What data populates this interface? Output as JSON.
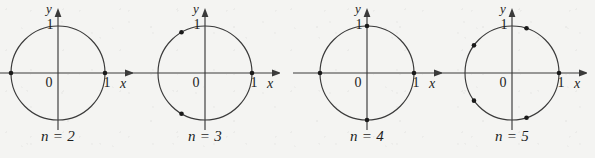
{
  "figure": {
    "background_color": "#f4f4f2",
    "stroke_color": "#3a3a3a",
    "dot_color": "#1a1a1a",
    "text_color": "#1d1d1d"
  },
  "axis_labels": {
    "origin": "0",
    "x_unit": "1",
    "y_unit": "1",
    "x_name": "x",
    "y_name": "y"
  },
  "chart_data": {
    "type": "scatter",
    "title": "",
    "xlabel": "x",
    "ylabel": "y",
    "xlim": [
      -1.35,
      1.45
    ],
    "ylim": [
      -1.3,
      1.35
    ],
    "grid": false,
    "legend": null,
    "annotations": [
      "0",
      "1",
      "1"
    ],
    "panels": [
      {
        "caption": "n = 2",
        "n": 2,
        "center_x": 58,
        "center_y": 73,
        "radius": 47,
        "angles_deg": [
          0,
          180
        ],
        "points": [
          [
            1,
            0
          ],
          [
            -1,
            0
          ]
        ]
      },
      {
        "caption": "n = 3",
        "n": 3,
        "center_x": 205,
        "center_y": 73,
        "radius": 47,
        "angles_deg": [
          0,
          120,
          240
        ],
        "points": [
          [
            1,
            0
          ],
          [
            -0.5,
            0.866
          ],
          [
            -0.5,
            -0.866
          ]
        ]
      },
      {
        "caption": "n = 4",
        "n": 4,
        "center_x": 367,
        "center_y": 73,
        "radius": 47,
        "angles_deg": [
          0,
          90,
          180,
          270
        ],
        "points": [
          [
            1,
            0
          ],
          [
            0,
            1
          ],
          [
            -1,
            0
          ],
          [
            0,
            -1
          ]
        ]
      },
      {
        "caption": "n = 5",
        "n": 5,
        "center_x": 512,
        "center_y": 73,
        "radius": 47,
        "angles_deg": [
          0,
          72,
          144,
          216,
          288
        ],
        "points": [
          [
            1,
            0
          ],
          [
            0.309,
            0.951
          ],
          [
            -0.809,
            0.588
          ],
          [
            -0.809,
            -0.588
          ],
          [
            0.309,
            -0.951
          ]
        ]
      }
    ]
  }
}
